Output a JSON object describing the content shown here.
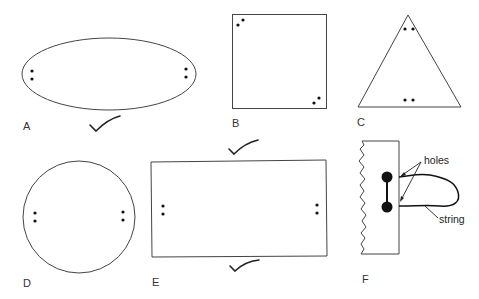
{
  "figure": {
    "panels": [
      {
        "label": "A",
        "shape": "ellipse",
        "holes": 4,
        "checked": true
      },
      {
        "label": "B",
        "shape": "square",
        "holes": 4,
        "checked": false
      },
      {
        "label": "C",
        "shape": "triangle",
        "holes": 4,
        "checked": false
      },
      {
        "label": "D",
        "shape": "circle",
        "holes": 4,
        "checked": false
      },
      {
        "label": "E",
        "shape": "rectangle",
        "holes": 4,
        "checked": true
      },
      {
        "label": "F",
        "shape": "torn-card-with-string",
        "holes": 2,
        "checked": false
      }
    ],
    "annotations": {
      "holes": "holes",
      "string": "string"
    },
    "colors": {
      "stroke": "#444444",
      "dot": "#111111",
      "background": "#ffffff"
    }
  }
}
